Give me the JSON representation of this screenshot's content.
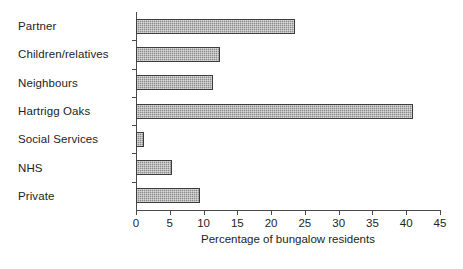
{
  "chart_data": {
    "type": "bar",
    "orientation": "horizontal",
    "title": "",
    "xlabel": "Percentage of bungalow residents",
    "ylabel": "",
    "categories": [
      "Partner",
      "Children/relatives",
      "Neighbours",
      "Hartrigg Oaks",
      "Social Services",
      "NHS",
      "Private"
    ],
    "values": [
      23.5,
      12.5,
      11.4,
      41.0,
      1.2,
      5.3,
      9.5
    ],
    "xlim": [
      0,
      45
    ],
    "xticks": [
      0,
      5,
      10,
      15,
      20,
      25,
      30,
      35,
      40,
      45
    ],
    "xtick_labels": [
      "0",
      "5",
      "10",
      "15",
      "20",
      "25",
      "30",
      "35",
      "40",
      "45"
    ],
    "grid": false,
    "legend": null,
    "bar_fill_color": "#8c8c8c",
    "bar_edge_color": "#3c3c3c",
    "axis_color": "#4a4a4a",
    "background_color": "#ffffff"
  }
}
